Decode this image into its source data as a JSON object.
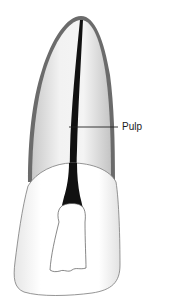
{
  "diagram": {
    "labels": [
      {
        "id": "pulp",
        "text": "Pulp"
      }
    ],
    "colors": {
      "background": "#ffffff",
      "root_outline": "#6b6b6b",
      "root_fill": "#e4e4e4",
      "crown_fill": "#f7f7f7",
      "crown_outline": "#7a7a7a",
      "pulp": "#111111",
      "leader_line": "#222222"
    }
  }
}
